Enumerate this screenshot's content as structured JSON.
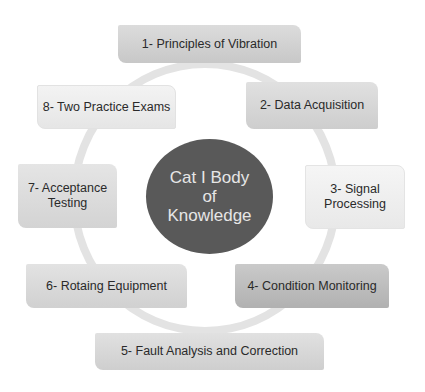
{
  "diagram": {
    "type": "cycle",
    "center": {
      "label": "Cat I Body\nof\nKnowledge",
      "color": "#595959"
    },
    "ring_color": "#e3e3e3",
    "items": [
      {
        "label": "1-  Principles of Vibration",
        "color": "#d0d0d0"
      },
      {
        "label": "2- Data Acquisition",
        "color": "#d6d6d6"
      },
      {
        "label": "3- Signal\nProcessing",
        "color": "#f2f2f2"
      },
      {
        "label": "4- Condition Monitoring",
        "color": "#b8b8b8"
      },
      {
        "label": "5- Fault Analysis and Correction",
        "color": "#d7d7d7"
      },
      {
        "label": "6- Rotaing Equipment",
        "color": "#d9d9d9"
      },
      {
        "label": "7- Acceptance\nTesting",
        "color": "#dcdcdc"
      },
      {
        "label": "8- Two Practice Exams",
        "color": "#efefef"
      }
    ]
  }
}
